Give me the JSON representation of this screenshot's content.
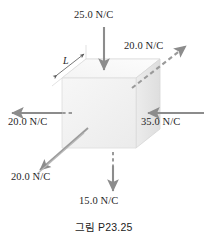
{
  "figure": {
    "caption": "그림 P23.25",
    "dimension_label": "L",
    "shape": "cube",
    "quantity": "electric field",
    "unit": "N/C"
  },
  "fields": {
    "top": {
      "label": "25.0 N/C",
      "magnitude": 25.0,
      "unit": "N/C",
      "direction": "down",
      "style": "solid",
      "face": "top"
    },
    "top_right": {
      "label": "20.0 N/C",
      "magnitude": 20.0,
      "unit": "N/C",
      "direction": "up-right",
      "style": "dashed",
      "face": "back"
    },
    "left": {
      "label": "20.0 N/C",
      "magnitude": 20.0,
      "unit": "N/C",
      "direction": "left",
      "style": "solid-with-hidden-dashes",
      "face": "left"
    },
    "right": {
      "label": "35.0 N/C",
      "magnitude": 35.0,
      "unit": "N/C",
      "direction": "left",
      "style": "solid",
      "face": "right"
    },
    "bottom_left": {
      "label": "20.0 N/C",
      "magnitude": 20.0,
      "unit": "N/C",
      "direction": "down-left",
      "style": "solid-double",
      "face": "front"
    },
    "bottom": {
      "label": "15.0 N/C",
      "magnitude": 15.0,
      "unit": "N/C",
      "direction": "down",
      "style": "solid-with-hidden-dashes",
      "face": "bottom"
    }
  },
  "colors": {
    "arrow": "#8c8c8c",
    "arrow_dark": "#7a7a7a",
    "cube_front": "#f2f2f2",
    "cube_top": "#fafafa",
    "cube_right": "#e8e8e8",
    "cube_edge": "#d8d8d8",
    "text": "#1f1f1f"
  }
}
